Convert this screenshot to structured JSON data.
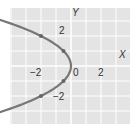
{
  "chart_data": {
    "type": "line",
    "title": "",
    "xlabel": "X",
    "ylabel": "Y",
    "equation": "x = -y^2/2",
    "xlim": [
      -4,
      4
    ],
    "ylim": [
      -4,
      4
    ],
    "grid": true,
    "x_ticks": [
      {
        "value": -2,
        "label": "−2"
      },
      {
        "value": 0,
        "label": "0"
      },
      {
        "value": 2,
        "label": "2"
      }
    ],
    "y_ticks": [
      {
        "value": 2,
        "label": "2"
      },
      {
        "value": -2,
        "label": "−2"
      }
    ],
    "series": [
      {
        "name": "parabola",
        "color": "#777777",
        "arrows_both_ends": true,
        "points": [
          {
            "x": -2,
            "y": 2
          },
          {
            "x": -0.5,
            "y": 1
          },
          {
            "x": 0,
            "y": 0
          },
          {
            "x": -0.5,
            "y": -1
          },
          {
            "x": -2,
            "y": -2
          }
        ]
      }
    ]
  },
  "labels": {
    "x_axis": "X",
    "y_axis": "Y",
    "tick_x_neg2": "−2",
    "tick_x_0": "0",
    "tick_x_2": "2",
    "tick_y_2": "2",
    "tick_y_neg2": "−2"
  }
}
